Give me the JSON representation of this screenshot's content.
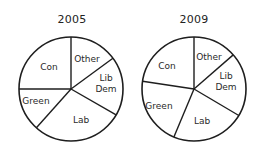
{
  "chart_data": [
    {
      "type": "pie",
      "title": "2005",
      "categories": [
        "Other",
        "Lib Dem",
        "Lab",
        "Green",
        "Con"
      ],
      "values": [
        14.9,
        18.4,
        28.3,
        13.4,
        25.0
      ],
      "start_angle": "12 o'clock",
      "direction": "clockwise",
      "labels_inside": true
    },
    {
      "type": "pie",
      "title": "2009",
      "categories": [
        "Other",
        "Lib Dem",
        "Lab",
        "Green",
        "Con"
      ],
      "values": [
        13.6,
        19.9,
        22.8,
        21.1,
        22.6
      ],
      "start_angle": "12 o'clock",
      "direction": "clockwise",
      "labels_inside": true
    }
  ],
  "pies": [
    {
      "title": "2005",
      "cx": 71,
      "cy": 89,
      "r": 52,
      "slices": [
        {
          "label": "Other",
          "lines": [
            "Other"
          ],
          "value": 14.9,
          "lx": 87,
          "ly": 59
        },
        {
          "label": "Lib Dem",
          "lines": [
            "Lib",
            "Dem"
          ],
          "value": 18.4,
          "lx": 106,
          "ly": 83
        },
        {
          "label": "Lab",
          "lines": [
            "Lab"
          ],
          "value": 28.3,
          "lx": 81,
          "ly": 120
        },
        {
          "label": "Green",
          "lines": [
            "Green"
          ],
          "value": 13.4,
          "lx": 36,
          "ly": 101
        },
        {
          "label": "Con",
          "lines": [
            "Con"
          ],
          "value": 25.0,
          "lx": 49,
          "ly": 67
        }
      ]
    },
    {
      "title": "2009",
      "cx": 194,
      "cy": 89,
      "r": 52,
      "slices": [
        {
          "label": "Other",
          "lines": [
            "Other"
          ],
          "value": 13.6,
          "lx": 209,
          "ly": 57
        },
        {
          "label": "Lib Dem",
          "lines": [
            "Lib",
            "Dem"
          ],
          "value": 19.9,
          "lx": 226,
          "ly": 81
        },
        {
          "label": "Lab",
          "lines": [
            "Lab"
          ],
          "value": 22.8,
          "lx": 202,
          "ly": 121
        },
        {
          "label": "Green",
          "lines": [
            "Green"
          ],
          "value": 21.1,
          "lx": 159,
          "ly": 106
        },
        {
          "label": "Con",
          "lines": [
            "Con"
          ],
          "value": 22.6,
          "lx": 167,
          "ly": 66
        }
      ]
    }
  ],
  "style": {
    "stroke": "#1e1e1e",
    "fill": "#ffffff"
  }
}
